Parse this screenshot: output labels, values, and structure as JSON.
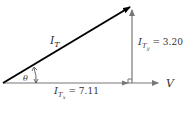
{
  "diagram": {
    "type": "phasor-diagram",
    "resultant": {
      "symbol": "I",
      "subscript": "T"
    },
    "vertical_component": {
      "symbol": "I",
      "subscript": "T",
      "subsubscript": "y",
      "value": "= 3.20"
    },
    "horizontal_component": {
      "symbol": "I",
      "subscript": "T",
      "subsubscript": "x",
      "value": "= 7.11"
    },
    "angle_label": "θ",
    "reference_axis_label": "V",
    "colors": {
      "resultant": "#000000",
      "components": "#777777",
      "text": "#333333"
    }
  }
}
